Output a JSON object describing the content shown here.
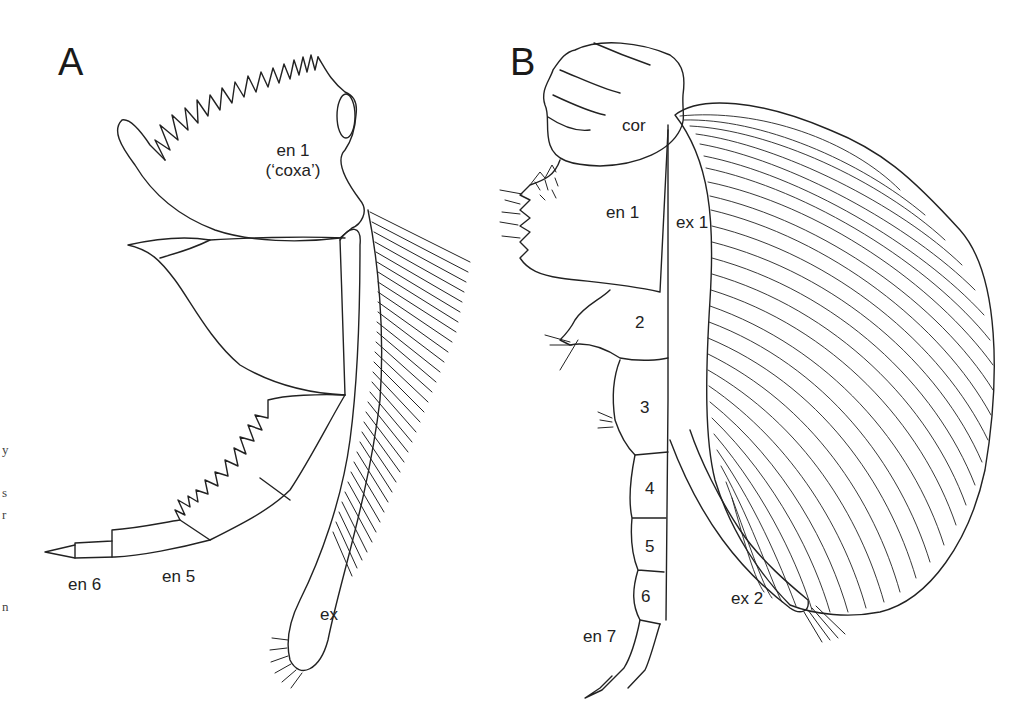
{
  "figure": {
    "panels": [
      {
        "letter": "A",
        "labels": {
          "en1_line1": "en 1",
          "en1_line2": "(‘coxa’)",
          "en6": "en 6",
          "en5": "en 5",
          "ex": "ex"
        }
      },
      {
        "letter": "B",
        "labels": {
          "cor": "cor",
          "en1": "en 1",
          "ex1": "ex 1",
          "seg2": "2",
          "seg3": "3",
          "seg4": "4",
          "seg5": "5",
          "seg6": "6",
          "en7": "en 7",
          "ex2": "ex 2"
        }
      }
    ],
    "cropped_caption_fragments": [
      "y",
      "s",
      "r",
      "n"
    ],
    "colors": {
      "line": "#222222",
      "background": "#ffffff"
    }
  }
}
